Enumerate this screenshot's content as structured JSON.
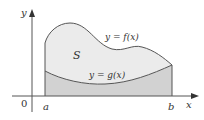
{
  "diagram": {
    "labels": {
      "y_axis": "y",
      "x_axis": "x",
      "origin": "0",
      "a": "a",
      "b": "b",
      "region": "S",
      "upper_curve": "y = f(x)",
      "lower_curve": "y = g(x)"
    },
    "colors": {
      "region_fill": "#ebebeb",
      "under_g_fill": "#d2d2d2",
      "curve_stroke": "#555555",
      "axis_stroke": "#555555",
      "text": "#333333"
    }
  }
}
